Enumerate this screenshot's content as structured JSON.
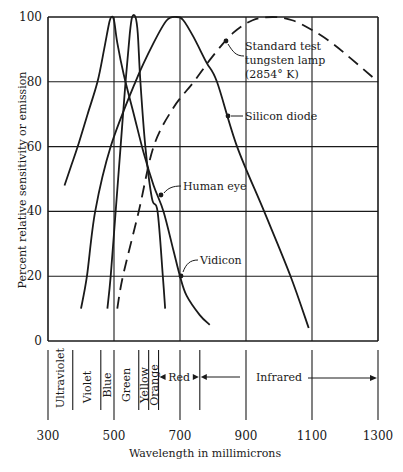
{
  "chart_data": {
    "type": "line",
    "title": "",
    "xlabel": "Wavelength in millimicrons",
    "ylabel": "Percent relative sensitivity or emission",
    "xlim": [
      300,
      1300
    ],
    "ylim": [
      0,
      100
    ],
    "x_ticks": [
      300,
      500,
      700,
      900,
      1100,
      1300
    ],
    "y_ticks": [
      0,
      20,
      40,
      60,
      80,
      100
    ],
    "grid": true,
    "series": [
      {
        "name": "Vidicon",
        "style": "solid",
        "x": [
          350,
          370,
          390,
          420,
          450,
          470,
          485,
          492,
          500,
          510,
          530,
          560,
          590,
          620,
          650,
          680,
          700,
          720,
          760,
          790
        ],
        "y": [
          48,
          54,
          60,
          70,
          80,
          90,
          98,
          100,
          99,
          92,
          82,
          70,
          58,
          48,
          40,
          28,
          20,
          14,
          8,
          5
        ]
      },
      {
        "name": "Human eye",
        "style": "solid",
        "x": [
          480,
          490,
          505,
          520,
          535,
          548,
          555,
          565,
          572,
          580,
          595,
          615,
          632,
          648,
          655
        ],
        "y": [
          10,
          20,
          40,
          60,
          80,
          95,
          100,
          100,
          95,
          80,
          60,
          44,
          40,
          20,
          10
        ]
      },
      {
        "name": "Silicon diode",
        "style": "solid",
        "x": [
          400,
          418,
          443,
          490,
          565,
          620,
          660,
          690,
          710,
          740,
          780,
          812,
          873,
          955,
          1035,
          1090
        ],
        "y": [
          10,
          20,
          40,
          60,
          80,
          92,
          99,
          100,
          99,
          94,
          86,
          80,
          60,
          40,
          20,
          4
        ]
      },
      {
        "name": "Standard test tungsten lamp (2854° K)",
        "style": "dashed",
        "x": [
          510,
          527,
          575,
          620,
          680,
          742,
          800,
          860,
          920,
          980,
          1040,
          1100,
          1160,
          1220,
          1300
        ],
        "y": [
          10,
          20,
          40,
          60,
          72,
          80,
          88,
          95,
          99,
          100,
          99,
          96,
          92,
          87,
          80
        ]
      }
    ],
    "annotations": [
      {
        "text": "Standard test",
        "x": 245,
        "y": 50
      },
      {
        "text": "tungsten lamp",
        "x": 245,
        "y": 64
      },
      {
        "text": "(2854° K)",
        "x": 245,
        "y": 78
      },
      {
        "text": "Silicon diode",
        "x": 245,
        "y": 120
      },
      {
        "text": "Human eye",
        "x": 183,
        "y": 190
      },
      {
        "text": "Vidicon",
        "x": 200,
        "y": 264
      }
    ],
    "spectrum_bands": [
      {
        "name": "Ultraviolet",
        "from": 300,
        "to": 375
      },
      {
        "name": "Violet",
        "from": 375,
        "to": 460
      },
      {
        "name": "Blue",
        "from": 460,
        "to": 500
      },
      {
        "name": "Green",
        "from": 500,
        "to": 575
      },
      {
        "name": "Yellow",
        "from": 575,
        "to": 605
      },
      {
        "name": "Orange",
        "from": 605,
        "to": 635
      },
      {
        "name": "Red",
        "from": 635,
        "to": 760
      },
      {
        "name": "Infrared",
        "from": 760,
        "to": 1300
      }
    ]
  }
}
